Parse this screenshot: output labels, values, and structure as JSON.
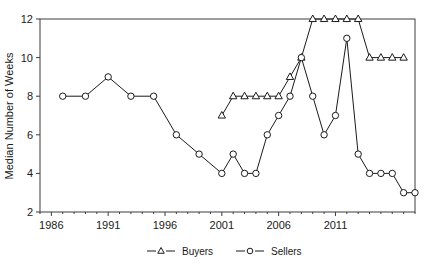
{
  "chart_data": {
    "type": "line",
    "title": "",
    "xlabel": "",
    "ylabel": "Median Number of Weeks",
    "xlim": [
      1985,
      2018
    ],
    "ylim": [
      2,
      12
    ],
    "xticks": [
      1986,
      1991,
      1996,
      2001,
      2006,
      2011
    ],
    "xtick_labels": [
      "1986",
      "1991",
      "1996",
      "2001",
      "2006",
      "2011"
    ],
    "yticks": [
      2,
      4,
      6,
      8,
      10,
      12
    ],
    "ytick_labels": [
      "2",
      "4",
      "6",
      "8",
      "10",
      "12"
    ],
    "grid": false,
    "legend_position": "bottom-center",
    "series": [
      {
        "name": "Buyers",
        "marker": "triangle",
        "color": "#1a1a1a",
        "x": [
          2001,
          2002,
          2003,
          2004,
          2005,
          2006,
          2007,
          2008,
          2009,
          2010,
          2011,
          2012,
          2013,
          2014,
          2015,
          2016,
          2017
        ],
        "values": [
          7,
          8,
          8,
          8,
          8,
          8,
          9,
          10,
          12,
          12,
          12,
          12,
          12,
          10,
          10,
          10,
          10
        ]
      },
      {
        "name": "Sellers",
        "marker": "circle",
        "color": "#1a1a1a",
        "x": [
          1987,
          1989,
          1991,
          1993,
          1995,
          1997,
          1999,
          2001,
          2002,
          2003,
          2004,
          2005,
          2006,
          2007,
          2008,
          2009,
          2010,
          2011,
          2012,
          2013,
          2014,
          2015,
          2016,
          2017,
          2018
        ],
        "values": [
          8,
          8,
          9,
          8,
          8,
          6,
          5,
          4,
          5,
          4,
          4,
          6,
          7,
          8,
          10,
          8,
          6,
          7,
          11,
          5,
          4,
          4,
          4,
          3,
          3
        ]
      }
    ]
  },
  "legend": {
    "entries": [
      {
        "label": "Buyers",
        "marker": "triangle-icon"
      },
      {
        "label": "Sellers",
        "marker": "circle-icon"
      }
    ]
  },
  "axes": {
    "y_title": "Median Number of Weeks"
  },
  "colors": {
    "line": "#1a1a1a",
    "axis": "#3c3c3c",
    "background": "#ffffff",
    "text": "#1a1a1a"
  }
}
